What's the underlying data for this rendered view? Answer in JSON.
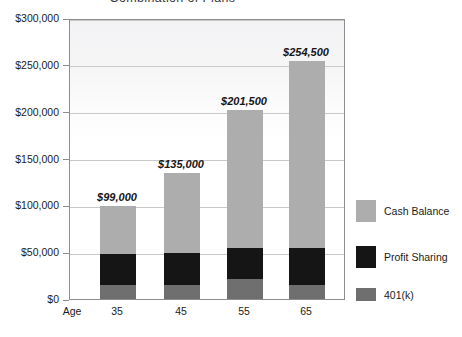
{
  "chart_data": {
    "type": "bar",
    "subtype": "stacked-bar",
    "title": "Combination of Plans",
    "xlabel": "Age",
    "ylabel": "",
    "categories": [
      "35",
      "45",
      "55",
      "65"
    ],
    "series": [
      {
        "name": "401(k)",
        "color": "#6f6f6f",
        "values": [
          15000,
          14500,
          21000,
          15000
        ]
      },
      {
        "name": "Profit Sharing",
        "color": "#151515",
        "values": [
          33000,
          34500,
          34000,
          40000
        ]
      },
      {
        "name": "Cash Balance",
        "color": "#adadad",
        "values": [
          51000,
          86000,
          146500,
          199500
        ]
      }
    ],
    "totals": [
      99000,
      135000,
      201500,
      254500
    ],
    "data_labels": [
      "$99,000",
      "$135,000",
      "$201,500",
      "$254,500"
    ],
    "ylim": [
      0,
      300000
    ],
    "ytick_values": [
      0,
      50000,
      100000,
      150000,
      200000,
      250000,
      300000
    ],
    "ytick_labels": [
      "$0",
      "$50,000",
      "$100,000",
      "$150,000",
      "$200,000",
      "$250,000",
      "$300,000"
    ],
    "grid": true,
    "legend_position": "right",
    "legend_order": [
      "Cash Balance",
      "Profit Sharing",
      "401(k)"
    ]
  },
  "legend": {
    "items": [
      {
        "label": "Cash Balance",
        "color": "#adadad"
      },
      {
        "label": "Profit Sharing",
        "color": "#151515"
      },
      {
        "label": "401(k)",
        "color": "#6f6f6f"
      }
    ]
  },
  "colors": {
    "cash_balance": "#adadad",
    "profit_sharing": "#151515",
    "k401": "#6f6f6f",
    "frame": "#8d8d8d",
    "gridline": "#c9c9c9",
    "text": "#1b1b1b"
  }
}
